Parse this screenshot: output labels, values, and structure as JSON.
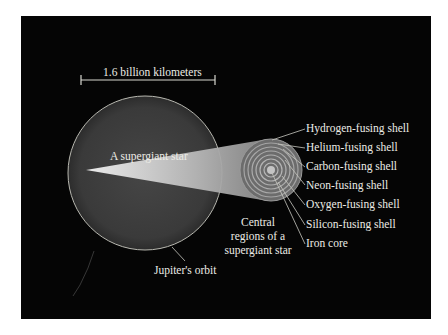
{
  "diagram": {
    "scale_bar_label": "1.6 billion kilometers",
    "star_label": "A supergiant star",
    "orbit_label": "Jupiter's orbit",
    "core_caption": [
      "Central",
      "regions of a",
      "supergiant star"
    ],
    "shells": [
      {
        "label": "Hydrogen-fusing shell"
      },
      {
        "label": "Helium-fusing shell"
      },
      {
        "label": "Carbon-fusing shell"
      },
      {
        "label": "Neon-fusing shell"
      },
      {
        "label": "Oxygen-fusing shell"
      },
      {
        "label": "Silicon-fusing shell"
      },
      {
        "label": "Iron core"
      }
    ],
    "colors": {
      "background": "#050505",
      "star_fill": "#3a3a3a",
      "orbit_line": "#b8b8b0",
      "label_text": "#ecece6"
    }
  }
}
